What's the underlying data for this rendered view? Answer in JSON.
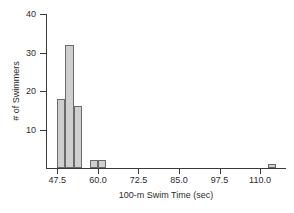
{
  "chart_data": {
    "type": "bar",
    "title": "",
    "subtitle": "",
    "xlabel": "100-m Swim Time (sec)",
    "ylabel": "# of Swimmers",
    "xlim": [
      44.0,
      118.0
    ],
    "ylim": [
      0,
      40
    ],
    "grid": false,
    "legend": null,
    "bin_width": 2.5,
    "xticks": [
      47.5,
      60.0,
      72.5,
      85.0,
      97.5,
      110.0
    ],
    "xtick_labels": [
      "47.5",
      "60.0",
      "72.5",
      "85.0",
      "97.5",
      "110.0"
    ],
    "yticks": [
      10,
      20,
      30,
      40
    ],
    "ytick_labels": [
      "10",
      "20",
      "30",
      "40"
    ],
    "bins": [
      {
        "label": "47.5-50.0",
        "x_left": 47.5,
        "x_right": 50.0,
        "value": 18
      },
      {
        "label": "50.0-52.5",
        "x_left": 50.0,
        "x_right": 52.5,
        "value": 32
      },
      {
        "label": "52.5-55.0",
        "x_left": 52.5,
        "x_right": 55.0,
        "value": 16
      },
      {
        "label": "57.5-60.0",
        "x_left": 57.5,
        "x_right": 60.0,
        "value": 2
      },
      {
        "label": "60.0-62.5",
        "x_left": 60.0,
        "x_right": 62.5,
        "value": 2
      },
      {
        "label": "112.5-115.0",
        "x_left": 112.5,
        "x_right": 115.0,
        "value": 1
      }
    ],
    "categories": [
      "47.5-50.0",
      "50.0-52.5",
      "52.5-55.0",
      "57.5-60.0",
      "60.0-62.5",
      "112.5-115.0"
    ],
    "values": [
      18,
      32,
      16,
      2,
      2,
      1
    ],
    "colors": {
      "bar_fill": "#cfcfcf",
      "bar_stroke": "#6a6a6a",
      "axis": "#3a3a3a",
      "text": "#2b2b2b",
      "background": "#ffffff"
    }
  }
}
